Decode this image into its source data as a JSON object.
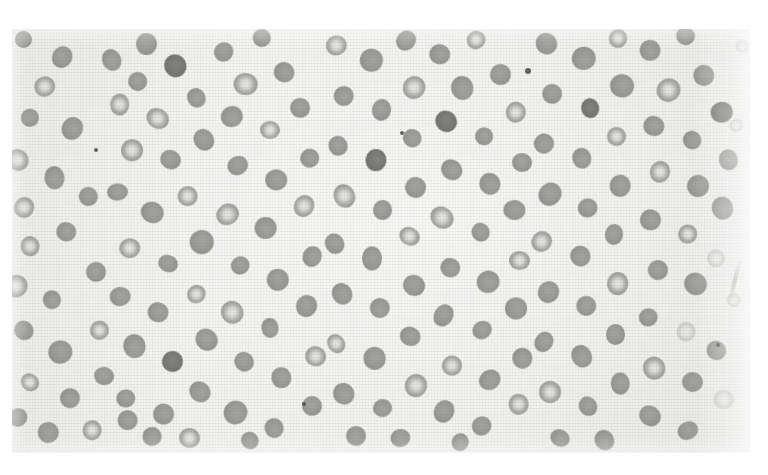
{
  "document": {
    "kind": "photomicrograph-plate",
    "caption": "",
    "page_background": "#ffffff"
  },
  "plate": {
    "name": "peripheral-blood-smear",
    "x": 12,
    "y": 29,
    "width": 738,
    "height": 424,
    "background_color": "#ededeb",
    "modality": "light-microscopy",
    "stain": "grayscale",
    "texture": "halftone-paper-weave",
    "notes": "Numerous red blood cells, many with prominent central pallor, scattered on a pale field."
  },
  "palette": {
    "field": "#ededeb",
    "cell_rim": "#96968f",
    "cell_center_pale": "#e2e2df",
    "cell_solid": "#989895",
    "cell_dark": "#717170",
    "speck": "#464644",
    "page": "#ffffff"
  },
  "artifacts": [
    {
      "name": "dust-speck-top",
      "x": 528,
      "y": 71,
      "r": 3.0
    },
    {
      "name": "dust-speck-left",
      "x": 96,
      "y": 150,
      "r": 2.4
    },
    {
      "name": "dust-speck-mid",
      "x": 402,
      "y": 133,
      "r": 2.0
    },
    {
      "name": "dust-speck-low",
      "x": 304,
      "y": 404,
      "r": 2.0
    },
    {
      "name": "dust-speck-edge",
      "x": 718,
      "y": 345,
      "r": 2.2
    },
    {
      "name": "emulsion-scratch-right",
      "x": 733,
      "y": 258,
      "w": 4,
      "h": 44,
      "rot": 14
    }
  ],
  "cells": [
    [
      24,
      40,
      19,
      "solid"
    ],
    [
      62,
      57,
      21,
      "solid"
    ],
    [
      45,
      86,
      20,
      "pallor"
    ],
    [
      30,
      118,
      18,
      "solid"
    ],
    [
      72,
      128,
      22,
      "solid"
    ],
    [
      18,
      160,
      20,
      "pallor"
    ],
    [
      54,
      178,
      22,
      "solid"
    ],
    [
      24,
      208,
      21,
      "pallor"
    ],
    [
      88,
      196,
      19,
      "solid"
    ],
    [
      30,
      246,
      20,
      "pallor"
    ],
    [
      66,
      232,
      18,
      "solid"
    ],
    [
      16,
      286,
      21,
      "pallor"
    ],
    [
      52,
      300,
      19,
      "solid"
    ],
    [
      96,
      272,
      21,
      "solid"
    ],
    [
      24,
      330,
      20,
      "solid"
    ],
    [
      60,
      352,
      22,
      "solid"
    ],
    [
      100,
      330,
      18,
      "pallor"
    ],
    [
      30,
      382,
      19,
      "pallor"
    ],
    [
      70,
      398,
      21,
      "solid"
    ],
    [
      104,
      376,
      20,
      "solid"
    ],
    [
      18,
      418,
      18,
      "solid"
    ],
    [
      48,
      432,
      20,
      "solid"
    ],
    [
      92,
      430,
      19,
      "pallor"
    ],
    [
      128,
      420,
      21,
      "solid"
    ],
    [
      112,
      60,
      20,
      "solid"
    ],
    [
      146,
      44,
      21,
      "solid"
    ],
    [
      138,
      82,
      19,
      "solid"
    ],
    [
      176,
      66,
      22,
      "dark"
    ],
    [
      120,
      104,
      20,
      "pallor"
    ],
    [
      158,
      118,
      21,
      "pallor"
    ],
    [
      196,
      98,
      19,
      "solid"
    ],
    [
      132,
      150,
      22,
      "pallor"
    ],
    [
      170,
      160,
      20,
      "solid"
    ],
    [
      204,
      140,
      21,
      "solid"
    ],
    [
      118,
      192,
      19,
      "solid"
    ],
    [
      152,
      212,
      22,
      "solid"
    ],
    [
      188,
      196,
      20,
      "pallor"
    ],
    [
      130,
      248,
      21,
      "pallor"
    ],
    [
      168,
      264,
      19,
      "solid"
    ],
    [
      202,
      242,
      22,
      "solid"
    ],
    [
      120,
      296,
      20,
      "solid"
    ],
    [
      158,
      312,
      21,
      "solid"
    ],
    [
      196,
      294,
      19,
      "pallor"
    ],
    [
      134,
      346,
      22,
      "solid"
    ],
    [
      172,
      362,
      20,
      "dark"
    ],
    [
      206,
      340,
      21,
      "solid"
    ],
    [
      126,
      398,
      19,
      "solid"
    ],
    [
      164,
      414,
      22,
      "solid"
    ],
    [
      200,
      392,
      20,
      "solid"
    ],
    [
      152,
      436,
      18,
      "solid"
    ],
    [
      190,
      438,
      20,
      "pallor"
    ],
    [
      224,
      52,
      21,
      "solid"
    ],
    [
      262,
      38,
      19,
      "solid"
    ],
    [
      246,
      84,
      22,
      "pallor"
    ],
    [
      284,
      72,
      20,
      "solid"
    ],
    [
      232,
      116,
      21,
      "solid"
    ],
    [
      270,
      130,
      19,
      "pallor"
    ],
    [
      300,
      108,
      22,
      "solid"
    ],
    [
      238,
      166,
      20,
      "solid"
    ],
    [
      276,
      180,
      21,
      "solid"
    ],
    [
      310,
      158,
      19,
      "solid"
    ],
    [
      228,
      214,
      22,
      "pallor"
    ],
    [
      266,
      228,
      20,
      "solid"
    ],
    [
      304,
      206,
      21,
      "pallor"
    ],
    [
      240,
      266,
      19,
      "solid"
    ],
    [
      278,
      280,
      22,
      "solid"
    ],
    [
      312,
      256,
      20,
      "solid"
    ],
    [
      232,
      312,
      21,
      "pallor"
    ],
    [
      270,
      328,
      19,
      "solid"
    ],
    [
      306,
      306,
      22,
      "solid"
    ],
    [
      244,
      362,
      20,
      "solid"
    ],
    [
      282,
      378,
      21,
      "solid"
    ],
    [
      316,
      356,
      19,
      "pallor"
    ],
    [
      236,
      412,
      22,
      "solid"
    ],
    [
      274,
      428,
      20,
      "solid"
    ],
    [
      312,
      406,
      21,
      "solid"
    ],
    [
      250,
      440,
      18,
      "solid"
    ],
    [
      336,
      46,
      20,
      "pallor"
    ],
    [
      372,
      60,
      22,
      "solid"
    ],
    [
      406,
      40,
      19,
      "solid"
    ],
    [
      344,
      96,
      21,
      "solid"
    ],
    [
      382,
      110,
      20,
      "solid"
    ],
    [
      414,
      88,
      22,
      "pallor"
    ],
    [
      338,
      146,
      19,
      "solid"
    ],
    [
      376,
      160,
      21,
      "dark"
    ],
    [
      412,
      138,
      20,
      "solid"
    ],
    [
      344,
      196,
      22,
      "pallor"
    ],
    [
      382,
      210,
      19,
      "solid"
    ],
    [
      416,
      188,
      21,
      "solid"
    ],
    [
      334,
      244,
      20,
      "solid"
    ],
    [
      372,
      258,
      22,
      "solid"
    ],
    [
      410,
      236,
      19,
      "pallor"
    ],
    [
      342,
      294,
      21,
      "solid"
    ],
    [
      380,
      308,
      20,
      "solid"
    ],
    [
      414,
      286,
      22,
      "solid"
    ],
    [
      336,
      344,
      19,
      "pallor"
    ],
    [
      374,
      358,
      21,
      "solid"
    ],
    [
      410,
      336,
      20,
      "solid"
    ],
    [
      344,
      394,
      22,
      "solid"
    ],
    [
      382,
      408,
      19,
      "solid"
    ],
    [
      416,
      386,
      21,
      "pallor"
    ],
    [
      356,
      436,
      19,
      "solid"
    ],
    [
      400,
      438,
      20,
      "solid"
    ],
    [
      440,
      54,
      21,
      "solid"
    ],
    [
      476,
      40,
      19,
      "pallor"
    ],
    [
      462,
      88,
      22,
      "solid"
    ],
    [
      500,
      74,
      20,
      "solid"
    ],
    [
      446,
      122,
      21,
      "dark"
    ],
    [
      484,
      136,
      19,
      "solid"
    ],
    [
      516,
      112,
      22,
      "pallor"
    ],
    [
      452,
      170,
      20,
      "solid"
    ],
    [
      490,
      184,
      21,
      "solid"
    ],
    [
      522,
      162,
      19,
      "solid"
    ],
    [
      442,
      218,
      22,
      "pallor"
    ],
    [
      480,
      232,
      20,
      "solid"
    ],
    [
      514,
      210,
      21,
      "solid"
    ],
    [
      450,
      268,
      19,
      "solid"
    ],
    [
      488,
      282,
      22,
      "solid"
    ],
    [
      520,
      260,
      20,
      "pallor"
    ],
    [
      444,
      316,
      21,
      "solid"
    ],
    [
      482,
      330,
      19,
      "solid"
    ],
    [
      516,
      308,
      22,
      "solid"
    ],
    [
      452,
      366,
      20,
      "pallor"
    ],
    [
      490,
      380,
      21,
      "solid"
    ],
    [
      522,
      358,
      19,
      "solid"
    ],
    [
      444,
      412,
      22,
      "solid"
    ],
    [
      482,
      426,
      20,
      "solid"
    ],
    [
      518,
      404,
      21,
      "pallor"
    ],
    [
      460,
      442,
      18,
      "solid"
    ],
    [
      546,
      44,
      20,
      "solid"
    ],
    [
      584,
      58,
      22,
      "solid"
    ],
    [
      618,
      38,
      19,
      "pallor"
    ],
    [
      552,
      94,
      21,
      "solid"
    ],
    [
      590,
      108,
      20,
      "dark"
    ],
    [
      622,
      86,
      22,
      "solid"
    ],
    [
      544,
      144,
      19,
      "solid"
    ],
    [
      582,
      158,
      21,
      "solid"
    ],
    [
      616,
      136,
      20,
      "pallor"
    ],
    [
      550,
      194,
      22,
      "solid"
    ],
    [
      588,
      208,
      19,
      "solid"
    ],
    [
      620,
      186,
      21,
      "solid"
    ],
    [
      542,
      242,
      20,
      "pallor"
    ],
    [
      580,
      256,
      22,
      "solid"
    ],
    [
      614,
      234,
      19,
      "solid"
    ],
    [
      548,
      292,
      21,
      "solid"
    ],
    [
      586,
      306,
      20,
      "solid"
    ],
    [
      618,
      284,
      22,
      "pallor"
    ],
    [
      544,
      342,
      19,
      "solid"
    ],
    [
      582,
      356,
      21,
      "solid"
    ],
    [
      616,
      334,
      20,
      "solid"
    ],
    [
      550,
      392,
      22,
      "pallor"
    ],
    [
      588,
      406,
      19,
      "solid"
    ],
    [
      620,
      384,
      21,
      "solid"
    ],
    [
      560,
      438,
      19,
      "solid"
    ],
    [
      604,
      440,
      20,
      "solid"
    ],
    [
      650,
      50,
      21,
      "solid"
    ],
    [
      686,
      36,
      19,
      "solid"
    ],
    [
      668,
      90,
      22,
      "pallor"
    ],
    [
      704,
      76,
      20,
      "solid"
    ],
    [
      654,
      126,
      21,
      "solid"
    ],
    [
      692,
      140,
      19,
      "solid"
    ],
    [
      722,
      112,
      22,
      "dark"
    ],
    [
      660,
      172,
      20,
      "pallor"
    ],
    [
      698,
      186,
      21,
      "solid"
    ],
    [
      728,
      160,
      19,
      "solid"
    ],
    [
      650,
      220,
      22,
      "solid"
    ],
    [
      688,
      234,
      20,
      "pallor"
    ],
    [
      722,
      208,
      21,
      "solid"
    ],
    [
      658,
      270,
      19,
      "solid"
    ],
    [
      696,
      284,
      22,
      "solid"
    ],
    [
      648,
      318,
      20,
      "solid"
    ],
    [
      686,
      332,
      21,
      "faint"
    ],
    [
      716,
      350,
      19,
      "solid"
    ],
    [
      654,
      368,
      22,
      "pallor"
    ],
    [
      692,
      382,
      20,
      "solid"
    ],
    [
      650,
      416,
      21,
      "solid"
    ],
    [
      688,
      430,
      19,
      "solid"
    ],
    [
      724,
      400,
      20,
      "faint"
    ],
    [
      716,
      258,
      18,
      "faint"
    ],
    [
      86,
      20,
      14,
      "solid"
    ],
    [
      210,
      18,
      13,
      "solid"
    ],
    [
      352,
      16,
      14,
      "solid"
    ],
    [
      498,
      18,
      13,
      "solid"
    ],
    [
      640,
      16,
      14,
      "solid"
    ],
    [
      742,
      46,
      13,
      "faint"
    ],
    [
      736,
      126,
      14,
      "faint"
    ],
    [
      734,
      300,
      13,
      "faint"
    ]
  ]
}
